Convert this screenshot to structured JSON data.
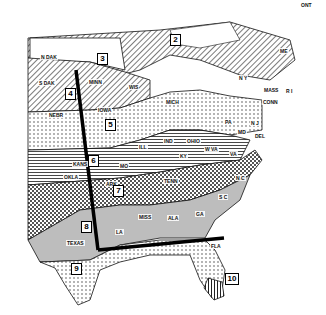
{
  "map": {
    "zones": [
      {
        "id": "2",
        "x": 170,
        "y": 34
      },
      {
        "id": "3",
        "x": 97,
        "y": 53
      },
      {
        "id": "4",
        "x": 65,
        "y": 88
      },
      {
        "id": "5",
        "x": 105,
        "y": 119
      },
      {
        "id": "6",
        "x": 88,
        "y": 155
      },
      {
        "id": "7",
        "x": 113,
        "y": 185
      },
      {
        "id": "8",
        "x": 81,
        "y": 221
      },
      {
        "id": "9",
        "x": 71,
        "y": 263
      },
      {
        "id": "10",
        "x": 225,
        "y": 273
      }
    ],
    "state_labels": [
      {
        "name": "N DAK",
        "x": 40,
        "y": 54
      },
      {
        "name": "S DAK",
        "x": 38,
        "y": 80
      },
      {
        "name": "MINN",
        "x": 88,
        "y": 79
      },
      {
        "name": "WIS",
        "x": 128,
        "y": 84
      },
      {
        "name": "NEBR",
        "x": 48,
        "y": 112
      },
      {
        "name": "IOWA",
        "x": 97,
        "y": 107
      },
      {
        "name": "MICH",
        "x": 165,
        "y": 99
      },
      {
        "name": "ILL",
        "x": 138,
        "y": 144
      },
      {
        "name": "IND",
        "x": 163,
        "y": 138
      },
      {
        "name": "OHIO",
        "x": 186,
        "y": 138
      },
      {
        "name": "PA",
        "x": 224,
        "y": 119
      },
      {
        "name": "W VA",
        "x": 204,
        "y": 146
      },
      {
        "name": "KY",
        "x": 179,
        "y": 153
      },
      {
        "name": "TENN",
        "x": 163,
        "y": 178
      },
      {
        "name": "VA",
        "x": 229,
        "y": 151
      },
      {
        "name": "N C",
        "x": 235,
        "y": 175
      },
      {
        "name": "S C",
        "x": 218,
        "y": 194
      },
      {
        "name": "GA",
        "x": 195,
        "y": 211
      },
      {
        "name": "ALA",
        "x": 167,
        "y": 215
      },
      {
        "name": "MISS",
        "x": 138,
        "y": 214
      },
      {
        "name": "LA",
        "x": 115,
        "y": 229
      },
      {
        "name": "ARK",
        "x": 105,
        "y": 181
      },
      {
        "name": "MO",
        "x": 119,
        "y": 163
      },
      {
        "name": "KANS",
        "x": 72,
        "y": 161
      },
      {
        "name": "OKLA",
        "x": 63,
        "y": 174
      },
      {
        "name": "TEXAS",
        "x": 66,
        "y": 240
      },
      {
        "name": "FLA",
        "x": 210,
        "y": 243
      },
      {
        "name": "N Y",
        "x": 238,
        "y": 75
      },
      {
        "name": "ME",
        "x": 279,
        "y": 48
      },
      {
        "name": "MASS",
        "x": 263,
        "y": 87
      },
      {
        "name": "CONN",
        "x": 262,
        "y": 99
      },
      {
        "name": "R I",
        "x": 285,
        "y": 88
      },
      {
        "name": "N J",
        "x": 250,
        "y": 120
      },
      {
        "name": "DEL",
        "x": 254,
        "y": 133
      },
      {
        "name": "MD",
        "x": 237,
        "y": 129
      },
      {
        "name": "ONT",
        "x": 300,
        "y": 2
      }
    ],
    "colors": {
      "ink": "#111111",
      "background": "#ffffff",
      "shade_light": "#e2e2e2",
      "shade_mid": "#b8b8b8",
      "shade_dark": "#6a6a6a"
    }
  }
}
